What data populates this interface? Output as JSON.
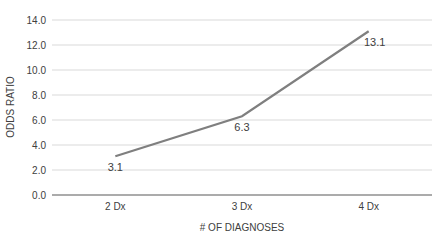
{
  "chart_data": {
    "type": "line",
    "title": "",
    "xlabel": "# OF DIAGNOSES",
    "ylabel": "ODDS RATIO",
    "categories": [
      "2 Dx",
      "3 Dx",
      "4 Dx"
    ],
    "series": [
      {
        "name": "Odds Ratio",
        "values": [
          3.1,
          6.3,
          13.1
        ],
        "color": "#7f7f7f"
      }
    ],
    "data_labels": [
      "3.1",
      "6.3",
      "13.1"
    ],
    "ylim": [
      0,
      14
    ],
    "yticks": [
      "0.0",
      "2.0",
      "4.0",
      "6.0",
      "8.0",
      "10.0",
      "12.0",
      "14.0"
    ],
    "grid": true,
    "legend": "none"
  }
}
